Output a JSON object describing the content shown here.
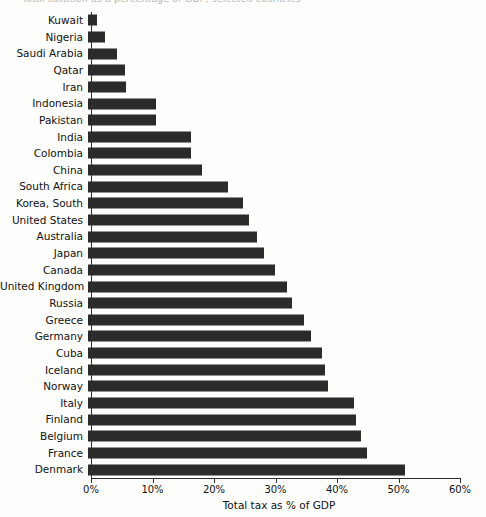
{
  "chart_data": {
    "type": "bar",
    "orientation": "horizontal",
    "title": "Total taxation as a percentage of GDP, selected countries",
    "xlabel": "Total tax as % of GDP",
    "ylabel": "",
    "xlim": [
      0,
      60
    ],
    "xticks": [
      0,
      10,
      20,
      30,
      40,
      50,
      60
    ],
    "xtick_labels": [
      "0%",
      "10%",
      "20%",
      "30%",
      "40%",
      "50%",
      "60%"
    ],
    "grid": false,
    "legend": false,
    "bar_color": "#2b2b2b",
    "categories": [
      "Kuwait",
      "Nigeria",
      "Saudi Arabia",
      "Qatar",
      "Iran",
      "Indonesia",
      "Pakistan",
      "India",
      "Colombia",
      "China",
      "South Africa",
      "Korea, South",
      "United States",
      "Australia",
      "Japan",
      "Canada",
      "United Kingdom",
      "Russia",
      "Greece",
      "Germany",
      "Cuba",
      "Iceland",
      "Norway",
      "Italy",
      "Finland",
      "Belgium",
      "France",
      "Denmark"
    ],
    "values": [
      1.5,
      2.8,
      4.7,
      6.0,
      6.2,
      11.0,
      11.0,
      16.8,
      16.8,
      18.6,
      22.8,
      25.2,
      26.1,
      27.4,
      28.6,
      30.4,
      32.4,
      33.2,
      35.1,
      36.3,
      38.0,
      38.5,
      39.1,
      43.3,
      43.6,
      44.4,
      45.3,
      51.5
    ]
  }
}
